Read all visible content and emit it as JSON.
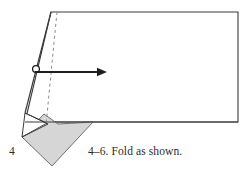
{
  "figure": {
    "step_number": "4",
    "caption": "4–6. Fold as shown.",
    "colors": {
      "outline": "#3a3a3a",
      "fold_line": "#8c8c8c",
      "shaded_fill": "#d6d6d6",
      "shaded_stroke": "#6f6f6f",
      "arrow": "#1d1d1d",
      "background": "#ffffff",
      "text": "#2b2b2b"
    },
    "shapes": {
      "paper_outline": {
        "name": "paper-sheet",
        "points": "51,12 238,12 238,122 25,122",
        "fill": "#ffffff"
      },
      "left_lower_flap": {
        "name": "lower-left-flap",
        "points": "25,122 22,137 44,114"
      },
      "fold_line_dashed": {
        "name": "valley-fold-line",
        "from_x": 57,
        "from_y": 12,
        "to_x": 46,
        "to_y": 125,
        "dash": "3 3"
      },
      "shaded_fold": {
        "name": "folded-under-region",
        "points": "93,122 52,166 22,137 44,114 58,124",
        "fill": "#d6d6d6"
      },
      "small_triangle": {
        "name": "small-crease-triangle",
        "points": "22,137 25,113 48,124"
      }
    },
    "arrow": {
      "name": "fold-direction-arrow",
      "loop_cx": 36,
      "loop_cy": 69,
      "loop_r": 3.6,
      "shaft_from_x": 36,
      "shaft_from_y": 72,
      "shaft_to_x": 100,
      "shaft_to_y": 72,
      "head_points": "107,72 98,68.5 98,75.5"
    }
  }
}
